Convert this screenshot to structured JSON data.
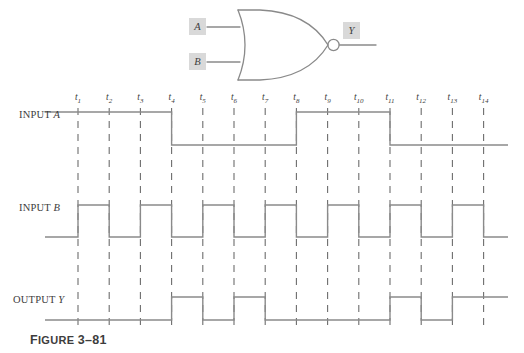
{
  "figure": {
    "caption_prefix": "F",
    "caption_rest": "IGURE",
    "caption_number": "3–81",
    "caption_full": "FIGURE 3–81"
  },
  "gate": {
    "type": "NOR",
    "input_a_label": "A",
    "input_b_label": "B",
    "output_label": "Y",
    "bubble": true,
    "line_color": "#8a8a8a",
    "pin_box_color": "#d9d9d9"
  },
  "timing": {
    "row_labels": {
      "input_a": "INPUT A",
      "input_a_name": "INPUT",
      "input_a_signal": "A",
      "input_b": "INPUT B",
      "input_b_name": "INPUT",
      "input_b_signal": "B",
      "output_y": "OUTPUT Y",
      "output_y_name": "OUTPUT",
      "output_y_signal": "Y"
    },
    "tick_labels": [
      "t1",
      "t2",
      "t3",
      "t4",
      "t5",
      "t6",
      "t7",
      "t8",
      "t9",
      "t10",
      "t11",
      "t12",
      "t13",
      "t14"
    ],
    "tick_subscripts": [
      "1",
      "2",
      "3",
      "4",
      "5",
      "6",
      "7",
      "8",
      "9",
      "10",
      "11",
      "12",
      "13",
      "14"
    ],
    "tick_base": "t",
    "waveform_color": "#8a8a8a",
    "dash_color": "#6d6d6d"
  },
  "chart_data": {
    "type": "line",
    "title": "FIGURE 3–81",
    "xlabel": "",
    "ylabel": "",
    "x": [
      "t0",
      "t1",
      "t2",
      "t3",
      "t4",
      "t5",
      "t6",
      "t7",
      "t8",
      "t9",
      "t10",
      "t11",
      "t12",
      "t13",
      "t14",
      "end"
    ],
    "series": [
      {
        "name": "INPUT A",
        "values": [
          1,
          1,
          1,
          1,
          0,
          0,
          0,
          0,
          1,
          1,
          1,
          0,
          0,
          0,
          0,
          0
        ]
      },
      {
        "name": "INPUT B",
        "values": [
          0,
          1,
          0,
          1,
          0,
          1,
          0,
          1,
          0,
          1,
          0,
          1,
          0,
          1,
          0,
          0
        ]
      },
      {
        "name": "OUTPUT Y",
        "values": [
          0,
          0,
          0,
          0,
          1,
          0,
          1,
          0,
          0,
          0,
          0,
          1,
          0,
          1,
          1,
          1
        ]
      }
    ],
    "note": "Y = NOR(A, B); Y is HIGH only when both A and B are LOW",
    "grid": true,
    "legend": "none"
  }
}
